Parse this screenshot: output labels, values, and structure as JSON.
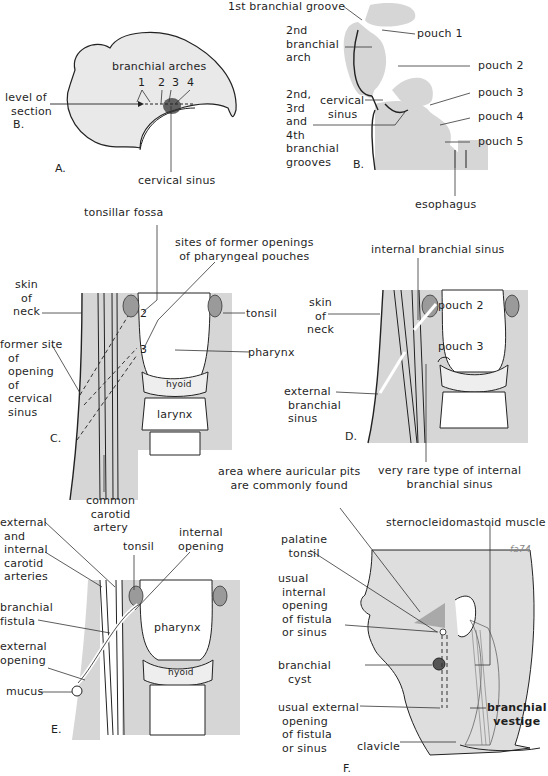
{
  "figure": {
    "panels": {
      "A": {
        "letter": "A.",
        "labels": {
          "branchial_arches": "branchial arches",
          "arch_numbers": [
            "1",
            "2",
            "3",
            "4"
          ],
          "level_of_section": [
            "level of",
            "section",
            "B."
          ],
          "cervical_sinus": "cervical sinus"
        }
      },
      "B": {
        "letter": "B.",
        "labels": {
          "first_groove": "1st branchial groove",
          "second_arch": [
            "2nd",
            "branchial",
            "arch"
          ],
          "cervical_sinus": [
            "cervical",
            "sinus"
          ],
          "grooves": [
            "2nd,",
            "3rd",
            "and",
            "4th",
            "branchial",
            "grooves"
          ],
          "pouches": [
            "pouch 1",
            "pouch 2",
            "pouch 3",
            "pouch 4",
            "pouch 5"
          ],
          "esophagus": "esophagus"
        }
      },
      "C": {
        "letter": "C.",
        "labels": {
          "tonsillar_fossa": "tonsillar fossa",
          "former_openings": [
            "sites of former openings",
            "of pharyngeal pouches"
          ],
          "skin_of_neck": [
            "skin",
            "of",
            "neck"
          ],
          "former_site": [
            "former site",
            "of",
            "opening",
            "of",
            "cervical",
            "sinus"
          ],
          "numbers": [
            "2",
            "3"
          ],
          "tonsil": "tonsil",
          "pharynx": "pharynx",
          "hyoid": "hyoid",
          "larynx": "larynx",
          "common_carotid": [
            "common",
            "carotid",
            "artery"
          ]
        }
      },
      "D": {
        "letter": "D.",
        "labels": {
          "internal_sinus": "internal branchial sinus",
          "skin_of_neck": [
            "skin",
            "of",
            "neck"
          ],
          "pouch_2": "pouch 2",
          "pouch_3": "pouch 3",
          "external_sinus": [
            "external",
            "branchial",
            "sinus"
          ],
          "very_rare": [
            "very rare type of internal",
            "branchial sinus"
          ]
        }
      },
      "E": {
        "letter": "E.",
        "labels": {
          "carotid_arteries": [
            "external",
            "and",
            "internal",
            "carotid",
            "arteries"
          ],
          "tonsil": "tonsil",
          "internal_opening": [
            "internal",
            "opening"
          ],
          "branchial_fistula": [
            "branchial",
            "fistula"
          ],
          "external_opening": [
            "external",
            "opening"
          ],
          "mucus": "mucus",
          "pharynx": "pharynx",
          "hyoid": "hyoid"
        }
      },
      "F": {
        "letter": "F.",
        "labels": {
          "auricular_pits": [
            "area where auricular pits",
            "are commonly found"
          ],
          "sternocleidomastoid": "sternocleidomastoid muscle",
          "palatine_tonsil": [
            "palatine",
            "tonsil"
          ],
          "usual_internal": [
            "usual",
            "internal",
            "opening",
            "of fistula",
            "or sinus"
          ],
          "branchial_cyst": [
            "branchial",
            "cyst"
          ],
          "usual_external": [
            "usual external",
            "opening",
            "of fistula",
            "or sinus"
          ],
          "branchial_vestige": [
            "branchial",
            "vestige"
          ],
          "clavicle": "clavicle",
          "signature": "fa74"
        }
      }
    }
  }
}
